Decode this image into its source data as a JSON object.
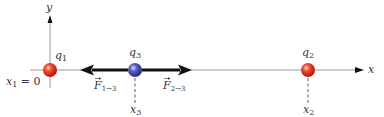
{
  "diagram": {
    "axes": {
      "x_label": "x",
      "y_label": "y"
    },
    "charges": [
      {
        "name": "q",
        "sub": "1",
        "color": "#d8261c",
        "highlight": "#ffb7a0",
        "position_label_var": "x",
        "position_label_sub": "1",
        "position_label_rest": " = 0"
      },
      {
        "name": "q",
        "sub": "3",
        "color": "#3a3fa8",
        "highlight": "#b8bcf0",
        "position_label_var": "x",
        "position_label_sub": "3"
      },
      {
        "name": "q",
        "sub": "2",
        "color": "#d8261c",
        "highlight": "#ffb7a0",
        "position_label_var": "x",
        "position_label_sub": "2"
      }
    ],
    "forces": [
      {
        "symbol": "F",
        "sub": "1→3",
        "direction": "left"
      },
      {
        "symbol": "F",
        "sub": "2→3",
        "direction": "right"
      }
    ],
    "colors": {
      "axis": "#888888",
      "force_arrow": "#111111",
      "text": "#333333"
    }
  }
}
